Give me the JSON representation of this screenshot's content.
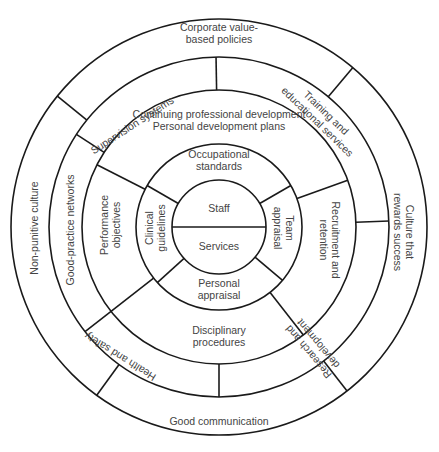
{
  "diagram": {
    "center": [
      219,
      227
    ],
    "colors": {
      "line": "#1a1a1a",
      "text": "#444444",
      "background": "#ffffff"
    },
    "radii": [
      47,
      83,
      137,
      170,
      208
    ],
    "core": {
      "top_label": "Staff",
      "bottom_label": "Services"
    },
    "rings": [
      {
        "name": "ring-2",
        "inner": 47,
        "outer": 83,
        "dividers_deg": [
          -150,
          -30,
          40,
          138
        ],
        "segments": [
          {
            "id": "occupational-standards",
            "lines": [
              "Occupational",
              "standards"
            ],
            "x": 219,
            "y": 210,
            "abs": [
              219,
              160
            ],
            "rot": 0
          },
          {
            "id": "team-appraisal",
            "lines": [
              "Team",
              "appraisal"
            ],
            "abs": [
              284,
              228
            ],
            "rot": 90
          },
          {
            "id": "personal-appraisal",
            "lines": [
              "Personal",
              "appraisal"
            ],
            "abs": [
              219,
              289
            ],
            "rot": 0
          },
          {
            "id": "clinical-guidelines",
            "lines": [
              "Clinical",
              "guidelines"
            ],
            "abs": [
              155,
              228
            ],
            "rot": -90
          }
        ]
      },
      {
        "name": "ring-3",
        "inner": 83,
        "outer": 137,
        "dividers_deg": [
          -153,
          -20,
          52,
          142
        ],
        "segments": [
          {
            "id": "continuing-professional-development",
            "lines": [
              "Continuing professional development",
              "Personal development plans"
            ],
            "abs": [
              219,
              120
            ],
            "rot": 0
          },
          {
            "id": "recruitment-and-retention",
            "lines": [
              "Recruitment and",
              "retention"
            ],
            "abs": [
              330,
              240
            ],
            "rot": 90
          },
          {
            "id": "disciplinary-procedures",
            "lines": [
              "Disciplinary",
              "procedures"
            ],
            "abs": [
              219,
              336
            ],
            "rot": 0
          },
          {
            "id": "performance-objectives",
            "lines": [
              "Performance",
              "objectives"
            ],
            "abs": [
              110,
              225
            ],
            "rot": -90
          }
        ]
      },
      {
        "name": "ring-4",
        "inner": 137,
        "outer": 170,
        "dividers_deg": [
          -91,
          -2,
          90,
          142,
          -147
        ],
        "segments": [
          {
            "id": "supervision-systems",
            "lines": [
              "Supervision systems"
            ],
            "abs": [
              132,
              125
            ],
            "rot": -33
          },
          {
            "id": "training-and-educational-services",
            "lines": [
              "Training and",
              "educational services"
            ],
            "abs": [
              322,
              117
            ],
            "rot": 44
          },
          {
            "id": "research-and-development",
            "lines": [
              "Research and",
              "development"
            ],
            "abs": [
              313,
              348
            ],
            "rot": -130
          },
          {
            "id": "health-and-safety",
            "lines": [
              "Health and safety"
            ],
            "abs": [
              120,
              357
            ],
            "rot": 212
          },
          {
            "id": "good-practice-networks",
            "lines": [
              "Good-practice networks"
            ],
            "abs": [
              70,
              230
            ],
            "rot": -90
          }
        ]
      },
      {
        "name": "ring-5",
        "inner": 170,
        "outer": 208,
        "dividers_deg": [
          -141,
          -50,
          52,
          126
        ],
        "segments": [
          {
            "id": "corporate-value-based-policies",
            "lines": [
              "Corporate value-",
              "based policies"
            ],
            "abs": [
              219,
              33
            ],
            "rot": 0
          },
          {
            "id": "culture-that-rewards-success",
            "lines": [
              "Culture that",
              "rewards success"
            ],
            "abs": [
              404,
              232
            ],
            "rot": 90
          },
          {
            "id": "good-communication",
            "lines": [
              "Good communication"
            ],
            "abs": [
              219,
              421
            ],
            "rot": 0
          },
          {
            "id": "non-punitive-culture",
            "lines": [
              "Non-punitive culture"
            ],
            "abs": [
              34,
              228
            ],
            "rot": -90
          }
        ]
      }
    ]
  }
}
